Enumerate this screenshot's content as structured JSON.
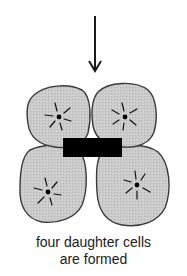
{
  "figure": {
    "caption_line1": "four daughter cells",
    "caption_line2": "are formed",
    "colors": {
      "cell_fill": "#c8c8c8",
      "cell_stroke": "#3a3a3a",
      "bar": "#000000",
      "arrow": "#1a1a1a",
      "nucleus": "#000000"
    },
    "arrow": {
      "x": 95,
      "y_start": 16,
      "y_end": 71,
      "direction": "down"
    },
    "bar": {
      "x": 63,
      "y": 138,
      "width": 59,
      "height": 19
    },
    "cells": [
      {
        "name": "top-left-cell",
        "nucleus": [
          59,
          117
        ]
      },
      {
        "name": "top-right-cell",
        "nucleus": [
          125,
          117
        ]
      },
      {
        "name": "bottom-left-cell",
        "nucleus": [
          48,
          192
        ]
      },
      {
        "name": "bottom-right-cell",
        "nucleus": [
          137,
          185
        ]
      }
    ]
  }
}
